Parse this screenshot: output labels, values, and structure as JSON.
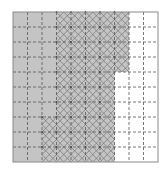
{
  "diagram": {
    "grid": {
      "rows": 10,
      "cols": 10,
      "origin_x": 13,
      "origin_y": 12,
      "cell_w": 14.5,
      "cell_h": 15
    },
    "colors": {
      "background": "#ffffff",
      "shaded_fill": "#c4c4c4",
      "hatch_line": "#747474",
      "grid_dash": "#555555",
      "border": "#8a8a8a"
    },
    "rows_spec": [
      {
        "row": 0,
        "shaded_cols": [
          0,
          7
        ],
        "hatched_cols": [
          3,
          7
        ]
      },
      {
        "row": 1,
        "shaded_cols": [
          0,
          7
        ],
        "hatched_cols": [
          3,
          7
        ]
      },
      {
        "row": 2,
        "shaded_cols": [
          0,
          7
        ],
        "hatched_cols": [
          3,
          7
        ]
      },
      {
        "row": 3,
        "shaded_cols": [
          0,
          7
        ],
        "hatched_cols": [
          3,
          7
        ]
      },
      {
        "row": 4,
        "shaded_cols": [
          0,
          6
        ],
        "hatched_cols": [
          3,
          6
        ]
      },
      {
        "row": 5,
        "shaded_cols": [
          0,
          6
        ],
        "hatched_cols": [
          3,
          6
        ]
      },
      {
        "row": 6,
        "shaded_cols": [
          0,
          6
        ],
        "hatched_cols": [
          3,
          6
        ]
      },
      {
        "row": 7,
        "shaded_cols": [
          0,
          6
        ],
        "hatched_cols": [
          2,
          6
        ]
      },
      {
        "row": 8,
        "shaded_cols": [
          0,
          6
        ],
        "hatched_cols": [
          2,
          6
        ]
      },
      {
        "row": 9,
        "shaded_cols": [
          0,
          6
        ],
        "hatched_cols": [
          2,
          6
        ]
      }
    ],
    "counts": {
      "total_cells": 100,
      "shaded_cells": 74,
      "hatched_cells": 50
    }
  }
}
